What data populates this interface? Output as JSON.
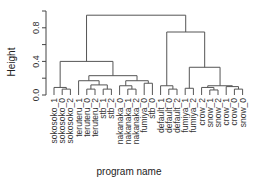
{
  "chart_data": {
    "type": "dendrogram",
    "title": "",
    "xlabel": "program name",
    "ylabel": "Height",
    "ylim": [
      0,
      1.0
    ],
    "yticks": [
      0.0,
      0.2,
      0.4,
      0.6,
      0.8,
      1.0
    ],
    "ytick_labels": [
      "0.0",
      "0.4",
      "0.8"
    ],
    "leaves": [
      "sokosoko_1",
      "sokosoko_0",
      "sokosoko_2",
      "teruteru_1",
      "teruteru_0",
      "teruteru_2",
      "stb_1",
      "stb_2",
      "nakanaka_0",
      "nakanaka_1",
      "nakanaka_2",
      "fumiya_0",
      "stb_0",
      "default_1",
      "default_0",
      "default_2",
      "fumiya_1",
      "fumiya_2",
      "crow_2",
      "snow_1",
      "snow_2",
      "crow_1",
      "crow_0",
      "snow_0"
    ],
    "merges": [
      {
        "left": "sokosoko_0",
        "right": "sokosoko_2",
        "height": 0.07
      },
      {
        "left": "sokosoko_1",
        "right": "[sokosoko_0,sokosoko_2]",
        "height": 0.09
      },
      {
        "left": "teruteru_0",
        "right": "teruteru_2",
        "height": 0.07
      },
      {
        "left": "stb_1",
        "right": "stb_2",
        "height": 0.07
      },
      {
        "left": "[teruteru_0,teruteru_2]",
        "right": "[stb_1,stb_2]",
        "height": 0.12
      },
      {
        "left": "teruteru_1",
        "right": "[teruteru_0,teruteru_2,stb_1,stb_2]",
        "height": 0.17
      },
      {
        "left": "nakanaka_1",
        "right": "nakanaka_2",
        "height": 0.07
      },
      {
        "left": "nakanaka_0",
        "right": "[nakanaka_1,nakanaka_2]",
        "height": 0.11
      },
      {
        "left": "fumiya_0",
        "right": "stb_0",
        "height": 0.14
      },
      {
        "left": "[nakanaka]",
        "right": "[fumiya_0,stb_0]",
        "height": 0.17
      },
      {
        "left": "[teruteru,stb]",
        "right": "[nakanaka,fumiya_0,stb_0]",
        "height": 0.23
      },
      {
        "left": "[sokosoko]",
        "right": "[teruteru,stb,nakanaka,fumiya_0,stb_0]",
        "height": 0.4
      },
      {
        "left": "default_0",
        "right": "default_2",
        "height": 0.07
      },
      {
        "left": "default_1",
        "right": "[default_0,default_2]",
        "height": 0.11
      },
      {
        "left": "fumiya_1",
        "right": "fumiya_2",
        "height": 0.08
      },
      {
        "left": "snow_1",
        "right": "snow_2",
        "height": 0.06
      },
      {
        "left": "crow_2",
        "right": "[snow_1,snow_2]",
        "height": 0.09
      },
      {
        "left": "crow_0",
        "right": "snow_0",
        "height": 0.07
      },
      {
        "left": "crow_1",
        "right": "[crow_0,snow_0]",
        "height": 0.1
      },
      {
        "left": "[crow_2,snow_1,snow_2]",
        "right": "[crow_1,crow_0,snow_0]",
        "height": 0.11
      },
      {
        "left": "[fumiya_1,fumiya_2]",
        "right": "[crow,snow]",
        "height": 0.33
      },
      {
        "left": "[default]",
        "right": "[fumiya_1,fumiya_2,crow,snow]",
        "height": 0.75
      },
      {
        "left": "[left cluster]",
        "right": "[right cluster]",
        "height": 0.95
      }
    ]
  },
  "labels": {
    "ylabel": "Height",
    "xlabel": "program name"
  }
}
